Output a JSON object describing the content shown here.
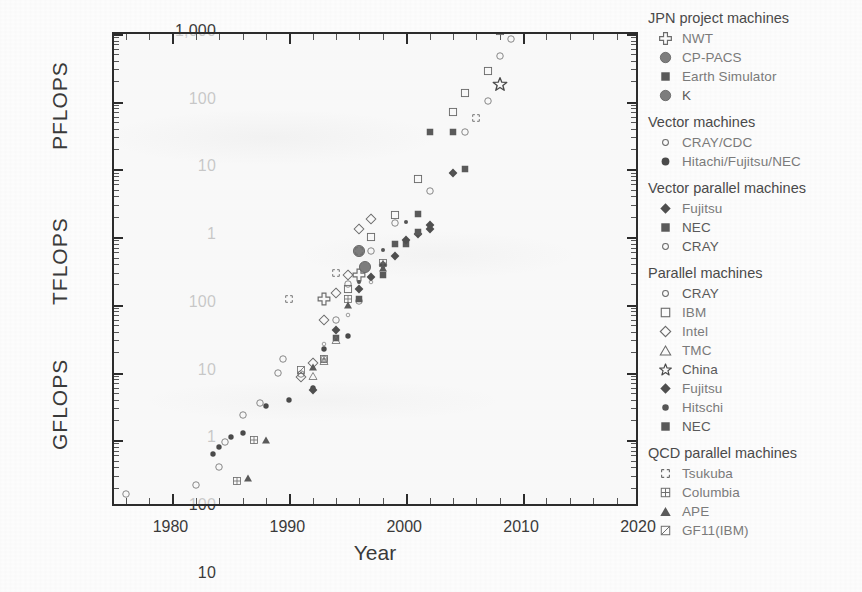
{
  "chart_data": {
    "type": "scatter",
    "title": "",
    "xlabel": "Year",
    "ylabel": "",
    "unit_labels": [
      "PFLOPS",
      "TFLOPS",
      "GFLOPS"
    ],
    "xlim": [
      1975,
      2020
    ],
    "xticks": [
      "1980",
      "1990",
      "2000",
      "2010",
      "2020"
    ],
    "xtick_values": [
      1980,
      1990,
      2000,
      2010,
      2020
    ],
    "x_minor_step": 2,
    "ylim_gflops": [
      0.1,
      1000000
    ],
    "yticks": [
      "1,000",
      "100",
      "10",
      "1",
      "100",
      "10",
      "1",
      "100",
      "10",
      "1",
      "0.1"
    ],
    "ytick_values": [
      1000000,
      100000,
      10000,
      1000,
      100,
      10,
      1,
      0.1,
      0.01,
      0.001,
      0.0001
    ],
    "grid": false,
    "legend_position": "right",
    "series": [
      {
        "name": "NWT",
        "group": "JPN project machines",
        "marker": "cross-outline",
        "points": [
          [
            1993.0,
            124
          ],
          [
            1996.0,
            280
          ]
        ]
      },
      {
        "name": "CP-PACS",
        "group": "JPN project machines",
        "marker": "circle-filled-large",
        "points": [
          [
            1996.0,
            614
          ],
          [
            1996.5,
            368
          ]
        ]
      },
      {
        "name": "Earth Simulator",
        "group": "JPN project machines",
        "marker": "square-filled",
        "points": [
          [
            2002.0,
            35600
          ],
          [
            2004.0,
            35600
          ]
        ]
      },
      {
        "name": "K",
        "group": "JPN project machines",
        "marker": "circle-filled-large",
        "points": [
          [
            2011.0,
            8162000
          ],
          [
            2011.5,
            10510000
          ]
        ]
      },
      {
        "name": "CRAY/CDC",
        "group": "Vector machines",
        "marker": "circle-open",
        "points": [
          [
            1976,
            0.16
          ],
          [
            1982,
            0.22
          ],
          [
            1984,
            0.4
          ],
          [
            1984.5,
            0.95
          ],
          [
            1986,
            2.4
          ],
          [
            1987.5,
            3.6
          ],
          [
            1989,
            10.0
          ],
          [
            1989.5,
            16.0
          ],
          [
            1991,
            9.6
          ],
          [
            1993,
            15.9
          ],
          [
            1994,
            60
          ],
          [
            1996,
            115
          ]
        ]
      },
      {
        "name": "Hitachi/Fujitsu/NEC",
        "group": "Vector machines",
        "marker": "circle-filled",
        "points": [
          [
            1983.5,
            0.63
          ],
          [
            1984,
            0.8
          ],
          [
            1985,
            1.1
          ],
          [
            1986,
            1.3
          ],
          [
            1988,
            3.2
          ],
          [
            1990,
            4.0
          ],
          [
            1992,
            6.0
          ],
          [
            1993,
            22
          ],
          [
            1995,
            35
          ]
        ]
      },
      {
        "name": "Fujitsu",
        "group": "Vector parallel machines",
        "marker": "diamond-filled",
        "points": [
          [
            1992,
            5.5
          ],
          [
            1994,
            42
          ],
          [
            1996,
            170
          ],
          [
            1997,
            260
          ],
          [
            1999,
            530
          ],
          [
            2001,
            1100
          ],
          [
            2002,
            1300
          ]
        ]
      },
      {
        "name": "NEC",
        "group": "Vector parallel machines",
        "marker": "square-filled",
        "points": [
          [
            1994,
            32
          ],
          [
            1996,
            120
          ],
          [
            1998,
            280
          ],
          [
            2000,
            800
          ],
          [
            2001,
            1200
          ]
        ]
      },
      {
        "name": "CRAY",
        "group": "Vector parallel machines",
        "marker": "circle-open-small",
        "points": [
          [
            1993,
            26
          ],
          [
            1995,
            70
          ],
          [
            1997,
            220
          ]
        ]
      },
      {
        "name": "CRAY",
        "group": "Parallel machines",
        "marker": "circle-open",
        "points": [
          [
            1995,
            200
          ],
          [
            1997,
            620
          ],
          [
            1999,
            1600
          ],
          [
            2002,
            4800
          ],
          [
            2005,
            36000
          ],
          [
            2007,
            102000
          ],
          [
            2008,
            478000
          ],
          [
            2009,
            830000
          ]
        ]
      },
      {
        "name": "IBM",
        "group": "Parallel machines",
        "marker": "square-open",
        "points": [
          [
            1995,
            170
          ],
          [
            1997,
            1000
          ],
          [
            1999,
            2100
          ],
          [
            2001,
            7200
          ],
          [
            2004,
            70000
          ],
          [
            2005,
            135000
          ],
          [
            2007,
            280000
          ],
          [
            2008,
            1100000
          ],
          [
            2011,
            16000000
          ],
          [
            2012,
            16300000
          ]
        ]
      },
      {
        "name": "Intel",
        "group": "Parallel machines",
        "marker": "diamond-open",
        "points": [
          [
            1991,
            8.6
          ],
          [
            1992,
            14
          ],
          [
            1993,
            60
          ],
          [
            1994,
            150
          ],
          [
            1995,
            280
          ],
          [
            1996,
            1340
          ],
          [
            1997,
            1830
          ]
        ]
      },
      {
        "name": "TMC",
        "group": "Parallel machines",
        "marker": "triangle-open",
        "points": [
          [
            1992,
            9.0
          ],
          [
            1993,
            15
          ],
          [
            1994,
            30
          ]
        ]
      },
      {
        "name": "China",
        "group": "Parallel machines",
        "marker": "star",
        "points": [
          [
            2010,
            2566000
          ],
          [
            2013,
            33860000
          ],
          [
            2008,
            180000
          ]
        ]
      },
      {
        "name": "Fujitsu",
        "group": "Parallel machines",
        "marker": "diamond-filled",
        "points": [
          [
            1998,
            390
          ],
          [
            2000,
            900
          ],
          [
            2002,
            1500
          ],
          [
            2004,
            8800
          ]
        ]
      },
      {
        "name": "Hitschi",
        "group": "Parallel machines",
        "marker": "circle-filled-small",
        "points": [
          [
            1996,
            220
          ],
          [
            1998,
            640
          ],
          [
            2000,
            1700
          ],
          [
            2004,
            9000
          ]
        ]
      },
      {
        "name": "NEC",
        "group": "Parallel machines",
        "marker": "square-filled",
        "points": [
          [
            1999,
            780
          ],
          [
            2001,
            2200
          ],
          [
            2005,
            10000
          ]
        ]
      },
      {
        "name": "Tsukuba",
        "group": "QCD parallel machines",
        "marker": "square-dashed",
        "points": [
          [
            1990,
            120
          ],
          [
            1994,
            300
          ],
          [
            1996,
            614
          ],
          [
            2006,
            57000
          ]
        ]
      },
      {
        "name": "Columbia",
        "group": "QCD parallel machines",
        "marker": "square-quad",
        "points": [
          [
            1985.5,
            0.25
          ],
          [
            1987,
            1.0
          ],
          [
            1993,
            16
          ],
          [
            1995,
            120
          ],
          [
            1998,
            420
          ]
        ]
      },
      {
        "name": "APE",
        "group": "QCD parallel machines",
        "marker": "triangle-filled",
        "points": [
          [
            1986.5,
            0.28
          ],
          [
            1988,
            1.0
          ],
          [
            1992,
            12
          ],
          [
            1995,
            100
          ],
          [
            1998,
            350
          ]
        ]
      },
      {
        "name": "GF11(IBM)",
        "group": "QCD parallel machines",
        "marker": "square-diagonal",
        "points": [
          [
            1991,
            11
          ]
        ]
      }
    ]
  },
  "axis": {
    "x_title": "Year",
    "x_ticks": [
      "1980",
      "1990",
      "2000",
      "2010",
      "2020"
    ],
    "y_ticks": [
      "1,000",
      "100",
      "10",
      "1",
      "100",
      "10",
      "1",
      "100",
      "10",
      "1",
      "0.1"
    ],
    "units": [
      "PFLOPS",
      "TFLOPS",
      "GFLOPS"
    ]
  },
  "legend": {
    "groups": [
      {
        "header": "JPN project machines",
        "entries": [
          {
            "label": "NWT",
            "marker": "cross-outline"
          },
          {
            "label": "CP-PACS",
            "marker": "circle-filled-large"
          },
          {
            "label": "Earth Simulator",
            "marker": "square-filled"
          },
          {
            "label": "K",
            "marker": "circle-filled-large"
          }
        ]
      },
      {
        "header": "Vector machines",
        "entries": [
          {
            "label": "CRAY/CDC",
            "marker": "circle-open-small"
          },
          {
            "label": "Hitachi/Fujitsu/NEC",
            "marker": "circle-filled"
          }
        ]
      },
      {
        "header": "Vector parallel machines",
        "entries": [
          {
            "label": "Fujitsu",
            "marker": "diamond-filled"
          },
          {
            "label": "NEC",
            "marker": "square-filled"
          },
          {
            "label": "CRAY",
            "marker": "circle-open-small"
          }
        ]
      },
      {
        "header": "Parallel machines",
        "entries": [
          {
            "label": "CRAY",
            "marker": "circle-open-small"
          },
          {
            "label": "IBM",
            "marker": "square-open"
          },
          {
            "label": "Intel",
            "marker": "diamond-open"
          },
          {
            "label": "TMC",
            "marker": "triangle-open"
          },
          {
            "label": "China",
            "marker": "star"
          },
          {
            "label": "Fujitsu",
            "marker": "diamond-filled"
          },
          {
            "label": "Hitschi",
            "marker": "circle-filled-small"
          },
          {
            "label": "NEC",
            "marker": "square-filled"
          }
        ]
      },
      {
        "header": "QCD parallel machines",
        "entries": [
          {
            "label": "Tsukuba",
            "marker": "square-dashed"
          },
          {
            "label": "Columbia",
            "marker": "square-quad"
          },
          {
            "label": "APE",
            "marker": "triangle-filled"
          },
          {
            "label": "GF11(IBM)",
            "marker": "square-diagonal"
          }
        ]
      }
    ]
  },
  "colors": {
    "axis": "#2c2c2c",
    "marker_dark": "#404040",
    "marker_mid": "#6b6b6b",
    "marker_light": "#8a8a8a",
    "legend_text": "#7a7a7a",
    "legend_head": "#4a4a4a",
    "background": "#fdfdfd"
  }
}
